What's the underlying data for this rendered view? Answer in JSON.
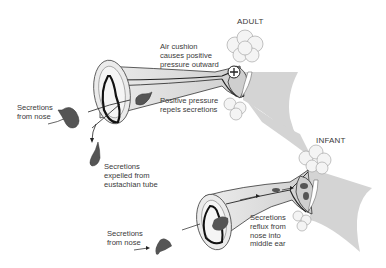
{
  "diagram": {
    "panels": [
      {
        "title": "ADULT",
        "labels": {
          "air_cushion": "Air cushion\ncauses positive\npressure outward",
          "positive_pressure": "Positive pressure\nrepels secretions",
          "secretions_nose": "Secretions\nfrom nose",
          "secretions_expelled": "Secretions\nexpelled from\neustachian tube"
        },
        "symbol": "+"
      },
      {
        "title": "INFANT",
        "labels": {
          "secretions_nose": "Secretions\nfrom nose",
          "secretions_reflux": "Secretions\nreflux from\nnose into\nmiddle ear"
        }
      }
    ],
    "colors": {
      "tube_fill": "#d9d9d9",
      "tube_light": "#ececec",
      "secretion": "#555555",
      "outline": "#222222",
      "cloud": "#f4f4f4",
      "membrane": "#d4d4d4",
      "text": "#3a3a3a"
    }
  }
}
